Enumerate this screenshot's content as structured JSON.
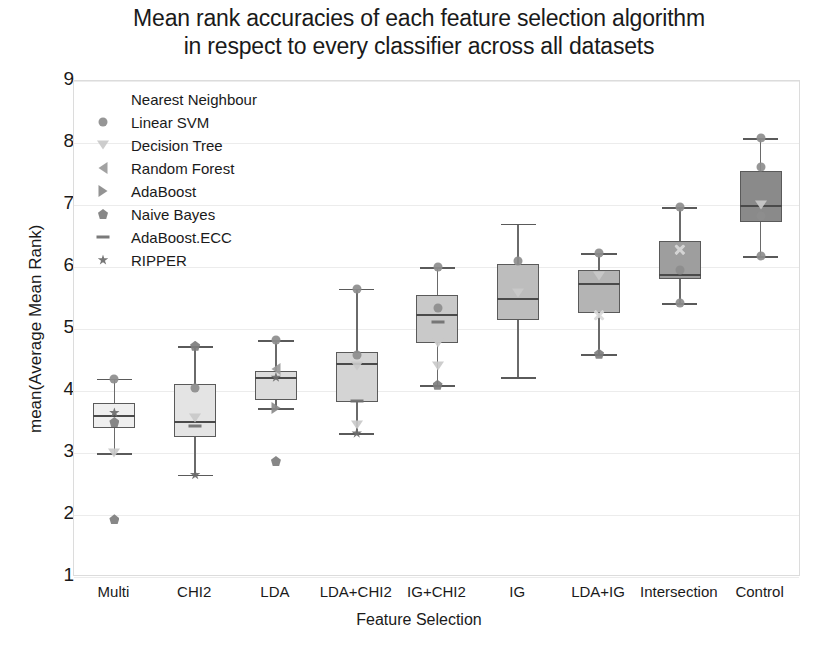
{
  "chart_data": {
    "type": "boxplot",
    "title": "Mean rank accuracies of each feature selection algorithm in respect to every classifier across all datasets",
    "title_line1": "Mean rank accuracies of each feature selection algorithm",
    "title_line2": "in respect to every classifier across all datasets",
    "xlabel": "Feature Selection",
    "ylabel": "mean(Average Mean Rank)",
    "ylim": [
      1,
      9
    ],
    "yticks": [
      1,
      2,
      3,
      4,
      5,
      6,
      7,
      8,
      9
    ],
    "grid": true,
    "legend_position": "upper-left",
    "categories": [
      "Multi",
      "CHI2",
      "LDA",
      "LDA+CHI2",
      "IG+CHI2",
      "IG",
      "LDA+IG",
      "Intersection",
      "Control"
    ],
    "legend": [
      {
        "label": "Nearest Neighbour",
        "marker": "none",
        "color": "#ffffff"
      },
      {
        "label": "Linear SVM",
        "marker": "circle",
        "color": "#d9d9d9"
      },
      {
        "label": "Decision Tree",
        "marker": "tdown",
        "color": "#c9c9c9"
      },
      {
        "label": "Random Forest",
        "marker": "tleft",
        "color": "#9a9a9a"
      },
      {
        "label": "AdaBoost",
        "marker": "tright",
        "color": "#8a8a8a"
      },
      {
        "label": "Naive Bayes",
        "marker": "pent",
        "color": "#7d7d7d"
      },
      {
        "label": "AdaBoost.ECC",
        "marker": "dash",
        "color": "#6f6f6f"
      },
      {
        "label": "RIPPER",
        "marker": "star",
        "color": "#6b6b6b"
      }
    ],
    "boxes": [
      {
        "category": "Multi",
        "whisker_low": 3.0,
        "q1": 3.4,
        "median": 3.62,
        "q3": 3.8,
        "whisker_high": 4.2,
        "fill": "#efefef",
        "points": [
          {
            "value": 4.2,
            "marker": "circle"
          },
          {
            "value": 3.65,
            "marker": "star"
          },
          {
            "value": 3.5,
            "marker": "pent"
          },
          {
            "value": 3.0,
            "marker": "tdown"
          },
          {
            "value": 1.93,
            "marker": "pent"
          }
        ]
      },
      {
        "category": "CHI2",
        "whisker_low": 2.65,
        "q1": 3.25,
        "median": 3.52,
        "q3": 4.12,
        "whisker_high": 4.73,
        "fill": "#e4e4e4",
        "points": [
          {
            "value": 4.73,
            "marker": "pent"
          },
          {
            "value": 4.05,
            "marker": "circle"
          },
          {
            "value": 3.56,
            "marker": "tdown"
          },
          {
            "value": 3.44,
            "marker": "dash"
          },
          {
            "value": 2.65,
            "marker": "star"
          }
        ]
      },
      {
        "category": "LDA",
        "whisker_low": 3.72,
        "q1": 3.85,
        "median": 4.22,
        "q3": 4.32,
        "whisker_high": 4.82,
        "fill": "#dcdcdc",
        "points": [
          {
            "value": 4.82,
            "marker": "circle"
          },
          {
            "value": 4.36,
            "marker": "tleft"
          },
          {
            "value": 4.22,
            "marker": "star"
          },
          {
            "value": 3.72,
            "marker": "tright"
          },
          {
            "value": 2.87,
            "marker": "pent"
          }
        ]
      },
      {
        "category": "LDA+CHI2",
        "whisker_low": 3.32,
        "q1": 3.82,
        "median": 4.45,
        "q3": 4.63,
        "whisker_high": 5.65,
        "fill": "#d4d4d4",
        "points": [
          {
            "value": 5.65,
            "marker": "circle"
          },
          {
            "value": 4.58,
            "marker": "circle"
          },
          {
            "value": 4.4,
            "marker": "tdown"
          },
          {
            "value": 3.84,
            "marker": "dash"
          },
          {
            "value": 3.45,
            "marker": "tdown"
          },
          {
            "value": 3.32,
            "marker": "star"
          }
        ]
      },
      {
        "category": "IG+CHI2",
        "whisker_low": 4.1,
        "q1": 4.77,
        "median": 5.25,
        "q3": 5.55,
        "whisker_high": 6.0,
        "fill": "#c9c9c9",
        "points": [
          {
            "value": 6.0,
            "marker": "circle"
          },
          {
            "value": 5.34,
            "marker": "circle"
          },
          {
            "value": 5.12,
            "marker": "dash"
          },
          {
            "value": 4.78,
            "marker": "tdown"
          },
          {
            "value": 4.4,
            "marker": "tdown"
          },
          {
            "value": 4.1,
            "marker": "pent"
          }
        ]
      },
      {
        "category": "IG",
        "whisker_low": 4.22,
        "q1": 5.15,
        "median": 5.5,
        "q3": 6.05,
        "whisker_high": 6.7,
        "fill": "#bdbdbd",
        "points": [
          {
            "value": 6.1,
            "marker": "circle"
          },
          {
            "value": 5.58,
            "marker": "tdown"
          }
        ]
      },
      {
        "category": "LDA+IG",
        "whisker_low": 4.6,
        "q1": 5.25,
        "median": 5.75,
        "q3": 5.95,
        "whisker_high": 6.22,
        "fill": "#b4b4b4",
        "points": [
          {
            "value": 6.22,
            "marker": "circle"
          },
          {
            "value": 5.85,
            "marker": "tdown"
          },
          {
            "value": 5.22,
            "marker": "xmark"
          },
          {
            "value": 4.6,
            "marker": "pent"
          }
        ]
      },
      {
        "category": "Intersection",
        "whisker_low": 5.42,
        "q1": 5.8,
        "median": 5.88,
        "q3": 6.42,
        "whisker_high": 6.97,
        "fill": "#9e9e9e",
        "points": [
          {
            "value": 6.97,
            "marker": "circle"
          },
          {
            "value": 6.28,
            "marker": "xmark"
          },
          {
            "value": 5.95,
            "marker": "circle"
          },
          {
            "value": 5.42,
            "marker": "circle"
          }
        ]
      },
      {
        "category": "Control",
        "whisker_low": 6.17,
        "q1": 6.73,
        "median": 7.0,
        "q3": 7.55,
        "whisker_high": 8.08,
        "fill": "#8a8a8a",
        "points": [
          {
            "value": 8.08,
            "marker": "circle"
          },
          {
            "value": 7.62,
            "marker": "circle"
          },
          {
            "value": 7.0,
            "marker": "tdown"
          },
          {
            "value": 6.82,
            "marker": "circle"
          },
          {
            "value": 6.17,
            "marker": "circle"
          }
        ]
      }
    ]
  }
}
